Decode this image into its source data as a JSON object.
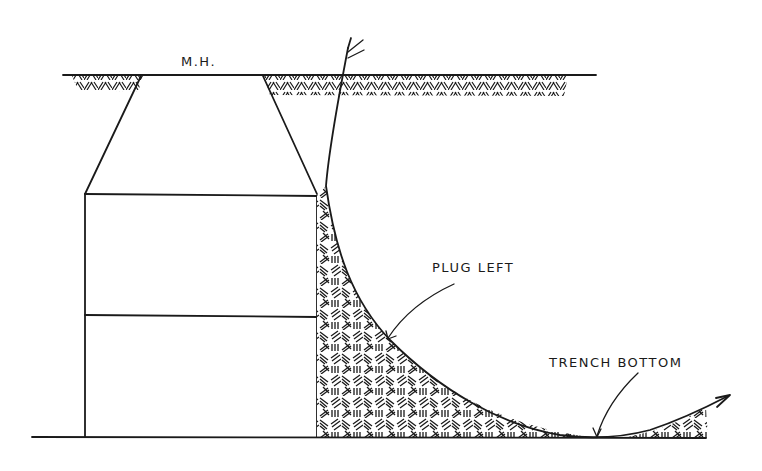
{
  "diagram": {
    "labels": {
      "manhole": "M.H.",
      "plug_left": "PLUG LEFT",
      "trench_bottom": "TRENCH BOTTOM"
    },
    "elements": {
      "ground_surface": "ground-surface-line",
      "manhole_cone": "manhole-cone",
      "manhole_barrel": "manhole-barrel-two-sections",
      "soil_plug": "soil-plug-hatched",
      "trench_curve": "excavation-curve-with-arrows",
      "trench_base": "trench-base-line"
    },
    "colors": {
      "ink": "#1a1a1a",
      "paper": "#ffffff"
    }
  }
}
